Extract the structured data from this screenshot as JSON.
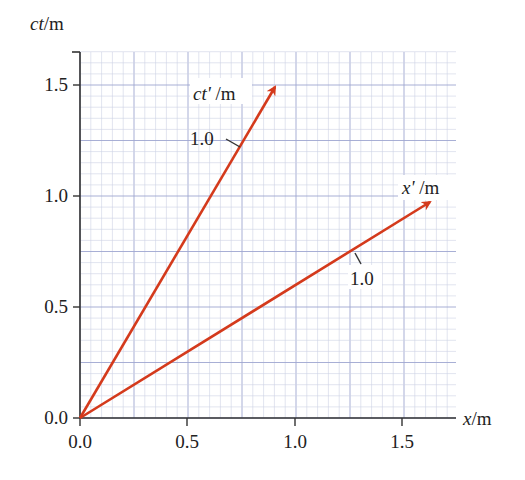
{
  "diagram": {
    "type": "spacetime-diagram",
    "y_axis_label_var": "ct",
    "y_axis_label_unit": "/m",
    "x_axis_label_var": "x",
    "x_axis_label_unit": "/m",
    "x_ticks": [
      "0.0",
      "0.5",
      "1.0",
      "1.5"
    ],
    "y_ticks": [
      "0.0",
      "0.5",
      "1.0",
      "1.5"
    ],
    "primed_time_axis": {
      "label_var": "ct'",
      "label_unit": " /m",
      "tick_label": "1.0",
      "end": [
        0.91,
        1.52
      ]
    },
    "primed_space_axis": {
      "label_var": "x'",
      "label_unit": " /m",
      "tick_label": "1.0",
      "end": [
        1.63,
        0.98
      ]
    },
    "colors": {
      "arrow": "#d43a1c",
      "grid_minor": "#cdd2e4",
      "grid_major": "#9ea6d0",
      "axis": "#333333"
    }
  },
  "chart_data": {
    "type": "line",
    "title": "",
    "xlabel": "x/m",
    "ylabel": "ct/m",
    "xlim": [
      0,
      1.72
    ],
    "ylim": [
      0,
      1.6
    ],
    "grid": true,
    "series": [
      {
        "name": "ct'/m axis",
        "x": [
          0,
          0.91
        ],
        "y": [
          0,
          1.52
        ],
        "tick_at": "1.0"
      },
      {
        "name": "x'/m axis",
        "x": [
          0,
          1.63
        ],
        "y": [
          0,
          0.98
        ],
        "tick_at": "1.0"
      }
    ]
  }
}
